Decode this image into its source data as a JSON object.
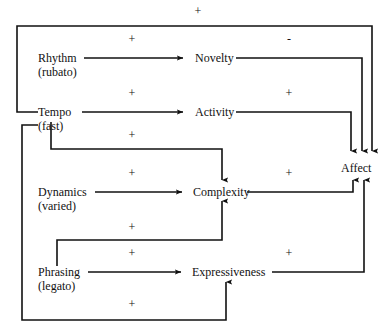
{
  "diagram": {
    "type": "causal-loop-diagram",
    "title": "",
    "nodes": [
      {
        "id": "rhythm",
        "name": "Rhythm",
        "qualifier": "(rubato)",
        "x": 38,
        "y": 52
      },
      {
        "id": "tempo",
        "name": "Tempo",
        "qualifier": "(fast)",
        "x": 38,
        "y": 106
      },
      {
        "id": "dynamics",
        "name": "Dynamics",
        "qualifier": "(varied)",
        "x": 38,
        "y": 186
      },
      {
        "id": "phrasing",
        "name": "Phrasing",
        "qualifier": "(legato)",
        "x": 38,
        "y": 266
      },
      {
        "id": "novelty",
        "name": "Novelty",
        "qualifier": "",
        "x": 195,
        "y": 52
      },
      {
        "id": "activity",
        "name": "Activity",
        "qualifier": "",
        "x": 195,
        "y": 106
      },
      {
        "id": "complexity",
        "name": "Complexity",
        "qualifier": "",
        "x": 193,
        "y": 186
      },
      {
        "id": "expressiveness",
        "name": "Expressiveness",
        "qualifier": "",
        "x": 192,
        "y": 266
      },
      {
        "id": "affect",
        "name": "Affect",
        "qualifier": "",
        "x": 341,
        "y": 162
      }
    ],
    "edges": [
      {
        "id": "rhythm-novelty",
        "from": "Rhythm",
        "to": "Novelty",
        "sign": "+",
        "sign_x": 131,
        "sign_y": 38
      },
      {
        "id": "tempo-activity",
        "from": "Tempo",
        "to": "Activity",
        "sign": "+",
        "sign_x": 131,
        "sign_y": 92
      },
      {
        "id": "tempo-complexity",
        "from": "Tempo",
        "to": "Complexity",
        "sign": "+",
        "sign_x": 131,
        "sign_y": 134
      },
      {
        "id": "dynamics-complexity",
        "from": "Dynamics",
        "to": "Complexity",
        "sign": "+",
        "sign_x": 131,
        "sign_y": 172
      },
      {
        "id": "phrasing-complexity",
        "from": "Phrasing",
        "to": "Complexity",
        "sign": "+",
        "sign_x": 131,
        "sign_y": 226
      },
      {
        "id": "phrasing-expressiveness",
        "from": "Phrasing",
        "to": "Expressiveness",
        "sign": "+",
        "sign_x": 131,
        "sign_y": 252
      },
      {
        "id": "novelty-affect",
        "from": "Novelty",
        "to": "Affect",
        "sign": "-",
        "sign_x": 288,
        "sign_y": 38
      },
      {
        "id": "activity-affect",
        "from": "Activity",
        "to": "Affect",
        "sign": "+",
        "sign_x": 288,
        "sign_y": 92
      },
      {
        "id": "complexity-affect",
        "from": "Complexity",
        "to": "Affect",
        "sign": "+",
        "sign_x": 288,
        "sign_y": 172
      },
      {
        "id": "expressiveness-affect",
        "from": "Expressiveness",
        "to": "Affect",
        "sign": "+",
        "sign_x": 288,
        "sign_y": 252
      },
      {
        "id": "rhythm-affect-top",
        "from": "Rhythm",
        "to": "Affect",
        "sign": "+",
        "sign_x": 197,
        "sign_y": 10
      },
      {
        "id": "tempo-expressiveness",
        "from": "Tempo",
        "to": "Expressiveness",
        "sign": "+",
        "sign_x": 131,
        "sign_y": 303
      }
    ],
    "signs": {
      "positive": "+",
      "negative": "–"
    },
    "colors": {
      "line": "#111111",
      "text": "#111111",
      "background": "#ffffff"
    }
  }
}
